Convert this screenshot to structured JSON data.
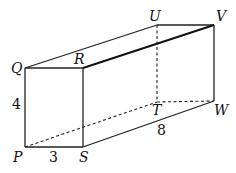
{
  "diagram": {
    "type": "cuboid",
    "vertices": {
      "P": {
        "label": "P",
        "x": 25,
        "y": 147
      },
      "Q": {
        "label": "Q",
        "x": 25,
        "y": 68
      },
      "R": {
        "label": "R",
        "x": 83,
        "y": 68
      },
      "S": {
        "label": "S",
        "x": 83,
        "y": 147
      },
      "T": {
        "label": "T",
        "x": 157,
        "y": 102
      },
      "U": {
        "label": "U",
        "x": 157,
        "y": 25
      },
      "V": {
        "label": "V",
        "x": 214,
        "y": 25
      },
      "W": {
        "label": "W",
        "x": 214,
        "y": 101
      }
    },
    "dimensions": {
      "PQ": "4",
      "PS": "3",
      "SW": "8"
    },
    "highlighted_segment": "RV",
    "hidden_edges": [
      "PT",
      "TU",
      "TW"
    ]
  }
}
